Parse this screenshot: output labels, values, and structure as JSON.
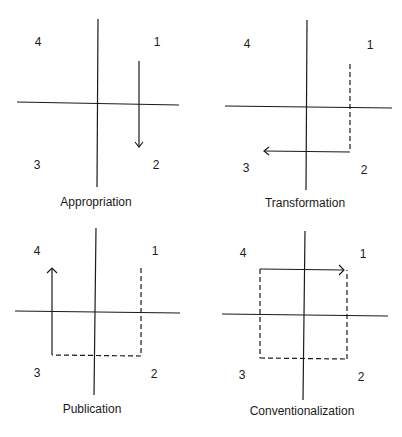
{
  "panels": [
    {
      "caption": "Appropriation",
      "quadrants": {
        "q1": "1",
        "q2": "2",
        "q3": "3",
        "q4": "4"
      }
    },
    {
      "caption": "Transformation",
      "quadrants": {
        "q1": "1",
        "q2": "2",
        "q3": "3",
        "q4": "4"
      }
    },
    {
      "caption": "Publication",
      "quadrants": {
        "q1": "1",
        "q2": "2",
        "q3": "3",
        "q4": "4"
      }
    },
    {
      "caption": "Conventionalization",
      "quadrants": {
        "q1": "1",
        "q2": "2",
        "q3": "3",
        "q4": "4"
      }
    }
  ],
  "colors": {
    "line": "#1a1a1a",
    "background": "#ffffff"
  }
}
